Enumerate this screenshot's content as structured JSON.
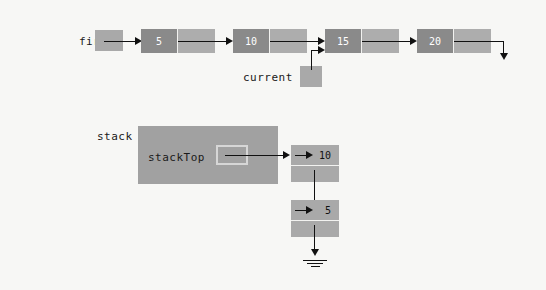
{
  "figure": {
    "background_color": "#f7f7f5",
    "stroke_color": "#111111"
  },
  "linked_list": {
    "head_label": "first",
    "head_pointer_name": "first-pointer-box",
    "current_label": "current",
    "nodes": [
      {
        "value": "5",
        "name": "node-5"
      },
      {
        "value": "10",
        "name": "node-10"
      },
      {
        "value": "15",
        "name": "node-15"
      },
      {
        "value": "20",
        "name": "node-20"
      }
    ],
    "current_points_to": "15",
    "tail_terminator": "down-arrow",
    "node_fill": "#8a8a8a",
    "link_fill": "#adadad",
    "pointer_fill": "#a9a9a9"
  },
  "stack": {
    "label": "stack",
    "field_label": "stackTop",
    "box_fill": "#a1a1a1",
    "slot_border": "#d6d6d6",
    "nodes": [
      {
        "value": "10",
        "name": "stack-node-10"
      },
      {
        "value": "5",
        "name": "stack-node-5"
      }
    ],
    "terminator": "ground-null-symbol"
  }
}
